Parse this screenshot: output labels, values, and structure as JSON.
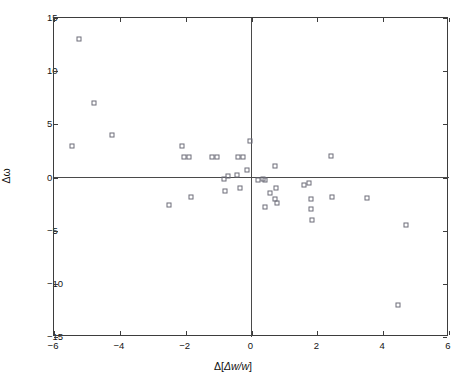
{
  "chart_data": {
    "type": "scatter",
    "title": "",
    "subtitle": "",
    "xlabel": "Δ[Δw/w]",
    "ylabel": "Δω",
    "xlim": [
      -6,
      6
    ],
    "ylim": [
      -15,
      15
    ],
    "xticks": [
      -6,
      -4,
      -2,
      0,
      2,
      4,
      6
    ],
    "yticks": [
      15,
      10,
      5,
      0,
      -5,
      -10,
      -15
    ],
    "xtick_labels": [
      "-6",
      "-4",
      "-2",
      "0",
      "2",
      "4",
      "6"
    ],
    "ytick_labels": [
      "15",
      "10",
      "5",
      "0",
      "-5",
      "-10",
      "-15"
    ],
    "grid": false,
    "legend": null,
    "marker": "open-square",
    "marker_color": "#6d6d78",
    "reference_lines": [
      {
        "axis": "horizontal",
        "value": 0
      },
      {
        "axis": "vertical",
        "value": 0
      }
    ],
    "series": [
      {
        "name": "points",
        "points": [
          [
            -5.45,
            3.0
          ],
          [
            -5.25,
            13.0
          ],
          [
            -4.8,
            7.0
          ],
          [
            -4.25,
            4.0
          ],
          [
            -2.5,
            -2.6
          ],
          [
            -2.1,
            3.0
          ],
          [
            -2.05,
            1.9
          ],
          [
            -1.9,
            1.9
          ],
          [
            -1.85,
            -1.8
          ],
          [
            -1.2,
            1.95
          ],
          [
            -1.05,
            1.95
          ],
          [
            -0.85,
            -0.1
          ],
          [
            -0.8,
            -1.3
          ],
          [
            -0.7,
            0.15
          ],
          [
            -0.45,
            0.2
          ],
          [
            -0.4,
            1.95
          ],
          [
            -0.35,
            -0.95
          ],
          [
            -0.25,
            1.95
          ],
          [
            -0.15,
            0.75
          ],
          [
            -0.05,
            3.45
          ],
          [
            0.2,
            -0.25
          ],
          [
            0.35,
            -0.15
          ],
          [
            0.4,
            -0.2
          ],
          [
            0.4,
            -2.8
          ],
          [
            0.55,
            -1.5
          ],
          [
            0.7,
            -2.0
          ],
          [
            0.72,
            1.05
          ],
          [
            0.75,
            -1.0
          ],
          [
            0.78,
            -2.4
          ],
          [
            1.6,
            -0.75
          ],
          [
            1.75,
            -0.55
          ],
          [
            1.8,
            -2.05
          ],
          [
            1.82,
            -3.0
          ],
          [
            1.85,
            -4.0
          ],
          [
            2.4,
            2.0
          ],
          [
            2.45,
            -1.8
          ],
          [
            3.5,
            -1.95
          ],
          [
            4.45,
            -12.0
          ],
          [
            4.7,
            -4.45
          ]
        ]
      }
    ]
  }
}
